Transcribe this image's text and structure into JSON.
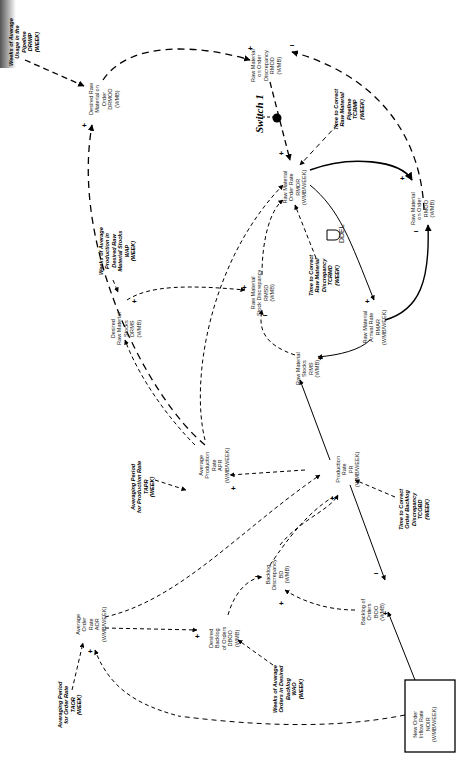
{
  "diagram": {
    "type": "causal-loop / stock-flow diagram (rotated 90 degrees)",
    "switch_label": "Switch 1",
    "delay_label": "DDEL",
    "nodes": [
      {
        "id": "wip",
        "label": "Weeks of Average\nUsage in the\nPipeline\nDRWIP\n(WEEK)",
        "bold": true
      },
      {
        "id": "drmoo",
        "label": "Desired Raw\nMaterial on\nOrder\nDRMOO\n(WMB)",
        "bold": false
      },
      {
        "id": "rmood",
        "label": "Raw Material\non Order\nDiscrepancy\nRMOD\n(WMB)",
        "bold": false
      },
      {
        "id": "ttcrmp",
        "label": "Time to Correct\nRaw Material\nPipeline\nTCRMP\n(WEEK)",
        "bold": true
      },
      {
        "id": "rmor",
        "label": "Raw Material\nOrder Rate\nRMOR\n(WMB/WEEK)",
        "bold": false
      },
      {
        "id": "rmoo",
        "label": "Raw Material\non Order\nRMOO\n(WMB)",
        "bold": false
      },
      {
        "id": "rmar",
        "label": "Raw Material\nArrival Rate\nRMAR\n(WMB/WEEK)",
        "bold": false
      },
      {
        "id": "ttcrmd",
        "label": "Time to Correct\nRaw Material\nDiscrepancy\nTCRMD\n(WEEK)",
        "bold": true
      },
      {
        "id": "rmsd",
        "label": "Raw Material\nStock Discrepancy\nRMSD\n(WMB)",
        "bold": false
      },
      {
        "id": "rms",
        "label": "Raw Material\nStocks\nRMS\n(WMB)",
        "bold": false
      },
      {
        "id": "wap",
        "label": "Weeks of Average\nProduction in\nDesired Raw\nMaterial Stocks\nWAP\n(WEEK)",
        "bold": true
      },
      {
        "id": "drms",
        "label": "Desired\nRaw Material\nStocks\nDRMS\n(WMB)",
        "bold": false
      },
      {
        "id": "apr",
        "label": "Average\nProduction\nRate\nAPR\n(WMB/WEEK)",
        "bold": false
      },
      {
        "id": "apfpr",
        "label": "Averaging Period\nfor Production Rate\nTAPR\n(WEEK)",
        "bold": true
      },
      {
        "id": "pr",
        "label": "Production\nRate\nPR\n(WMB/WEEK)",
        "bold": false
      },
      {
        "id": "ttcobd",
        "label": "Time to Correct\nOrder Backlog\nDiscrepancy\nTCOBD\n(WEEK)",
        "bold": true
      },
      {
        "id": "bd",
        "label": "Backlog\nDiscrepancy\nBD\n(WMB)",
        "bold": false
      },
      {
        "id": "boo",
        "label": "Backlog of\nOrders\nBOO\n(WMB)",
        "bold": false
      },
      {
        "id": "dbo",
        "label": "Desired\nBacklog\nof Orders\nDBOO\n(WMB)",
        "bold": false
      },
      {
        "id": "wao",
        "label": "Weeks of Average\nOrders in Desired\nBacklog\nWAO\n(WEEK)",
        "bold": true
      },
      {
        "id": "aor",
        "label": "Average\nOrder\nRate\nAOR\n(WMB/WEEK)",
        "bold": false
      },
      {
        "id": "apfor",
        "label": "Averaging Period\nfor Order Rate\nTAOR\n(WEEK)",
        "bold": true
      },
      {
        "id": "noir",
        "label": "New Order\nInflow Rate\nNOIR\n(WMB/WEEK)",
        "bold": false
      }
    ]
  }
}
